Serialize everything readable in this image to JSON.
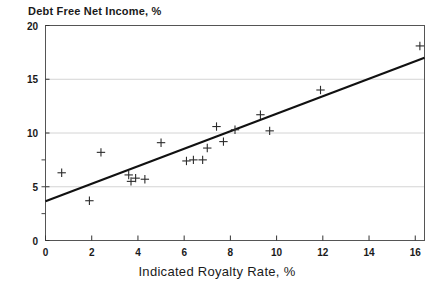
{
  "chart_data": {
    "type": "scatter",
    "title": "Debt Free Net Income, %",
    "xlabel": "Indicated Royalty Rate, %",
    "ylabel": "",
    "xlim": [
      0,
      16.4
    ],
    "ylim": [
      0,
      20
    ],
    "xticks": [
      0,
      2,
      4,
      6,
      8,
      10,
      12,
      14,
      16
    ],
    "yticks": [
      0,
      5,
      10,
      15,
      20
    ],
    "xtick_labels": [
      "0",
      "2",
      "4",
      "6",
      "8",
      "10",
      "12",
      "14",
      "16"
    ],
    "ytick_labels": [
      "0",
      "5",
      "10",
      "15",
      "20"
    ],
    "grid": "horizontal-major",
    "legend": "none",
    "marker": "plus",
    "series": [
      {
        "name": "Observations",
        "points": [
          {
            "x": 0.7,
            "y": 6.3
          },
          {
            "x": 1.9,
            "y": 3.7
          },
          {
            "x": 2.4,
            "y": 8.2
          },
          {
            "x": 3.6,
            "y": 6.1
          },
          {
            "x": 3.7,
            "y": 5.5
          },
          {
            "x": 3.9,
            "y": 5.8
          },
          {
            "x": 4.3,
            "y": 5.7
          },
          {
            "x": 5.0,
            "y": 9.1
          },
          {
            "x": 6.1,
            "y": 7.4
          },
          {
            "x": 6.4,
            "y": 7.5
          },
          {
            "x": 6.8,
            "y": 7.5
          },
          {
            "x": 7.0,
            "y": 8.6
          },
          {
            "x": 7.4,
            "y": 10.6
          },
          {
            "x": 7.7,
            "y": 9.2
          },
          {
            "x": 8.2,
            "y": 10.3
          },
          {
            "x": 9.3,
            "y": 11.7
          },
          {
            "x": 9.7,
            "y": 10.2
          },
          {
            "x": 11.9,
            "y": 14.0
          },
          {
            "x": 16.2,
            "y": 18.1
          }
        ]
      }
    ],
    "trendline": {
      "name": "Least squares fit",
      "x0": 0.0,
      "y0": 3.65,
      "x1": 16.4,
      "y1": 17.0
    }
  },
  "axes": {
    "x_axis_name": "indicated-royalty-rate-axis",
    "y_axis_name": "debt-free-net-income-axis"
  }
}
